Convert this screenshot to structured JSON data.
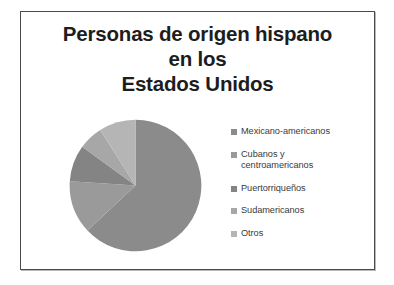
{
  "slide": {
    "title_lines": [
      "Personas de origen hispano",
      "en los",
      "Estados Unidos"
    ]
  },
  "chart_data": {
    "type": "pie",
    "title": "Personas de origen hispano en los Estados Unidos",
    "legend_position": "right",
    "grid": false,
    "categories": [
      "Mexicano-americanos",
      "Cubanos y\ncentroamericanos",
      "Puertorriqueños",
      "Sudamericanos",
      "Otros"
    ],
    "values": [
      63,
      13,
      9,
      6,
      9
    ],
    "colors": [
      "#8b8b8b",
      "#9a9a9a",
      "#848484",
      "#a7a7a7",
      "#b5b5b5"
    ],
    "start_angle_deg": 0,
    "direction": "clockwise"
  },
  "legend": {
    "items": [
      {
        "label": "Mexicano-americanos",
        "color": "#8b8b8b"
      },
      {
        "label": "Cubanos y\ncentroamericanos",
        "color": "#9a9a9a"
      },
      {
        "label": "Puertorriqueños",
        "color": "#848484"
      },
      {
        "label": "Sudamericanos",
        "color": "#a7a7a7"
      },
      {
        "label": "Otros",
        "color": "#b5b5b5"
      }
    ]
  }
}
